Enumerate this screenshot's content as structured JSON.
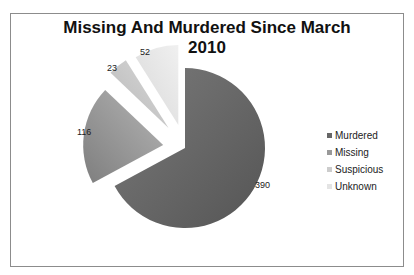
{
  "chart_data": {
    "type": "pie",
    "title": "Missing And Murdered Since March 2010",
    "categories": [
      "Murdered",
      "Missing",
      "Suspicious",
      "Unknown"
    ],
    "values": [
      390,
      116,
      23,
      52
    ],
    "colors": [
      "#6a6a6a",
      "#909090",
      "#c4c4c4",
      "#e2e2e2"
    ],
    "exploded": true,
    "legend_position": "right"
  },
  "chart": {
    "title_line1": "Missing And Murdered Since March",
    "title_line2": "2010",
    "labels": [
      "390",
      "116",
      "23",
      "52"
    ],
    "legend": [
      "Murdered",
      "Missing",
      "Suspicious",
      "Unknown"
    ]
  }
}
